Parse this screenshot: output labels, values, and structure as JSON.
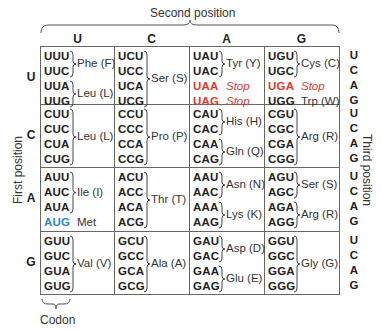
{
  "titles": {
    "second_position": "Second position",
    "first_position": "First position",
    "third_position": "Third position",
    "codon_label": "Codon"
  },
  "bases": [
    "U",
    "C",
    "A",
    "G"
  ],
  "colors": {
    "stop": "#e03a2c",
    "start": "#2f86cf",
    "grid": "#666666"
  },
  "rows": [
    {
      "first": "U",
      "cells": [
        {
          "second": "U",
          "codons": [
            {
              "c": "UUU"
            },
            {
              "c": "UUC"
            },
            {
              "c": "UUA"
            },
            {
              "c": "UUG"
            }
          ],
          "groups": [
            {
              "label": "Phe (F)",
              "span": [
                0,
                1
              ]
            },
            {
              "label": "Leu (L)",
              "span": [
                2,
                3
              ]
            }
          ]
        },
        {
          "second": "C",
          "codons": [
            {
              "c": "UCU"
            },
            {
              "c": "UCC"
            },
            {
              "c": "UCA"
            },
            {
              "c": "UCG"
            }
          ],
          "groups": [
            {
              "label": "Ser (S)",
              "span": [
                0,
                3
              ]
            }
          ]
        },
        {
          "second": "A",
          "codons": [
            {
              "c": "UAU"
            },
            {
              "c": "UAC"
            },
            {
              "c": "UAA",
              "type": "stop"
            },
            {
              "c": "UAG",
              "type": "stop"
            }
          ],
          "groups": [
            {
              "label": "Tyr (Y)",
              "span": [
                0,
                1
              ]
            },
            {
              "label": "Stop",
              "span": [
                2,
                2
              ],
              "type": "stop"
            },
            {
              "label": "Stop",
              "span": [
                3,
                3
              ],
              "type": "stop"
            }
          ]
        },
        {
          "second": "G",
          "codons": [
            {
              "c": "UGU"
            },
            {
              "c": "UGC"
            },
            {
              "c": "UGA",
              "type": "stop"
            },
            {
              "c": "UGG"
            }
          ],
          "groups": [
            {
              "label": "Cys (C)",
              "span": [
                0,
                1
              ]
            },
            {
              "label": "Stop",
              "span": [
                2,
                2
              ],
              "type": "stop"
            },
            {
              "label": "Trp (W)",
              "span": [
                3,
                3
              ]
            }
          ]
        }
      ]
    },
    {
      "first": "C",
      "cells": [
        {
          "second": "U",
          "codons": [
            {
              "c": "CUU"
            },
            {
              "c": "CUC"
            },
            {
              "c": "CUA"
            },
            {
              "c": "CUG"
            }
          ],
          "groups": [
            {
              "label": "Leu (L)",
              "span": [
                0,
                3
              ]
            }
          ]
        },
        {
          "second": "C",
          "codons": [
            {
              "c": "CCU"
            },
            {
              "c": "CCC"
            },
            {
              "c": "CCA"
            },
            {
              "c": "CCG"
            }
          ],
          "groups": [
            {
              "label": "Pro (P)",
              "span": [
                0,
                3
              ]
            }
          ]
        },
        {
          "second": "A",
          "codons": [
            {
              "c": "CAU"
            },
            {
              "c": "CAC"
            },
            {
              "c": "CAA"
            },
            {
              "c": "CAG"
            }
          ],
          "groups": [
            {
              "label": "His (H)",
              "span": [
                0,
                1
              ]
            },
            {
              "label": "Gln (Q)",
              "span": [
                2,
                3
              ]
            }
          ]
        },
        {
          "second": "G",
          "codons": [
            {
              "c": "CGU"
            },
            {
              "c": "CGC"
            },
            {
              "c": "CGA"
            },
            {
              "c": "CGG"
            }
          ],
          "groups": [
            {
              "label": "Arg (R)",
              "span": [
                0,
                3
              ]
            }
          ]
        }
      ]
    },
    {
      "first": "A",
      "cells": [
        {
          "second": "U",
          "codons": [
            {
              "c": "AUU"
            },
            {
              "c": "AUC"
            },
            {
              "c": "AUA"
            },
            {
              "c": "AUG",
              "type": "start"
            }
          ],
          "groups": [
            {
              "label": "Ile (I)",
              "span": [
                0,
                2
              ]
            },
            {
              "label": "Met",
              "span": [
                3,
                3
              ]
            }
          ]
        },
        {
          "second": "C",
          "codons": [
            {
              "c": "ACU"
            },
            {
              "c": "ACC"
            },
            {
              "c": "ACA"
            },
            {
              "c": "ACG"
            }
          ],
          "groups": [
            {
              "label": "Thr (T)",
              "span": [
                0,
                3
              ]
            }
          ]
        },
        {
          "second": "A",
          "codons": [
            {
              "c": "AAU"
            },
            {
              "c": "AAC"
            },
            {
              "c": "AAA"
            },
            {
              "c": "AAG"
            }
          ],
          "groups": [
            {
              "label": "Asn (N)",
              "span": [
                0,
                1
              ]
            },
            {
              "label": "Lys (K)",
              "span": [
                2,
                3
              ]
            }
          ]
        },
        {
          "second": "G",
          "codons": [
            {
              "c": "AGU"
            },
            {
              "c": "AGC"
            },
            {
              "c": "AGA"
            },
            {
              "c": "AGG"
            }
          ],
          "groups": [
            {
              "label": "Ser (S)",
              "span": [
                0,
                1
              ]
            },
            {
              "label": "Arg (R)",
              "span": [
                2,
                3
              ]
            }
          ]
        }
      ]
    },
    {
      "first": "G",
      "cells": [
        {
          "second": "U",
          "codons": [
            {
              "c": "GUU"
            },
            {
              "c": "GUC"
            },
            {
              "c": "GUA"
            },
            {
              "c": "GUG"
            }
          ],
          "groups": [
            {
              "label": "Val (V)",
              "span": [
                0,
                3
              ]
            }
          ]
        },
        {
          "second": "C",
          "codons": [
            {
              "c": "GCU"
            },
            {
              "c": "GCC"
            },
            {
              "c": "GCA"
            },
            {
              "c": "GCG"
            }
          ],
          "groups": [
            {
              "label": "Ala (A)",
              "span": [
                0,
                3
              ]
            }
          ]
        },
        {
          "second": "A",
          "codons": [
            {
              "c": "GAU"
            },
            {
              "c": "GAC"
            },
            {
              "c": "GAA"
            },
            {
              "c": "GAG"
            }
          ],
          "groups": [
            {
              "label": "Asp (D)",
              "span": [
                0,
                1
              ]
            },
            {
              "label": "Glu (E)",
              "span": [
                2,
                3
              ]
            }
          ]
        },
        {
          "second": "G",
          "codons": [
            {
              "c": "GGU"
            },
            {
              "c": "GGC"
            },
            {
              "c": "GGA"
            },
            {
              "c": "GGG"
            }
          ],
          "groups": [
            {
              "label": "Gly (G)",
              "span": [
                0,
                3
              ]
            }
          ]
        }
      ]
    }
  ]
}
